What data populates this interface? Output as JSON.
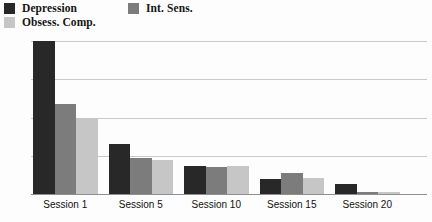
{
  "chart_data": {
    "type": "bar",
    "title": "",
    "subtitle": "",
    "xlabel": "",
    "ylabel": "",
    "categories": [
      "Session 1",
      "Session 5",
      "Session 10",
      "Session 15",
      "Session 20"
    ],
    "series": [
      {
        "name": "Depression",
        "color": "#282828",
        "values": [
          28,
          9.2,
          5.1,
          2.8,
          1.8
        ]
      },
      {
        "name": "Obsess. Comp.",
        "color": "#c6c6c6",
        "values": [
          14,
          6.3,
          5.2,
          2.9,
          0.4
        ]
      },
      {
        "name": "Int. Sens.",
        "color": "#7c7c7c",
        "values": [
          16.5,
          6.5,
          4.9,
          3.9,
          0.3
        ]
      }
    ],
    "series_draw_order": [
      "Depression",
      "Int. Sens.",
      "Obsess. Comp."
    ],
    "yticks": [
      0,
      7,
      14,
      21,
      28
    ],
    "ytick_labels": [
      "0",
      "7",
      "14",
      "21",
      "28"
    ],
    "ylim": [
      0,
      28
    ],
    "grid": true,
    "grid_color": "#c9c9c9",
    "axis_color": "#8f8f8f",
    "legend_position": "top-left",
    "background": "#fdfdfd"
  },
  "legend": {
    "items": [
      {
        "label": "Depression",
        "color": "#282828"
      },
      {
        "label": "Obsess. Comp.",
        "color": "#c6c6c6"
      },
      {
        "label": "Int. Sens.",
        "color": "#7c7c7c"
      }
    ]
  },
  "axis": {
    "y_labels": [
      "28",
      "21",
      "14",
      "7",
      "0"
    ],
    "x_labels": [
      "Session 1",
      "Session 5",
      "Session 10",
      "Session 15",
      "Session 20"
    ]
  }
}
